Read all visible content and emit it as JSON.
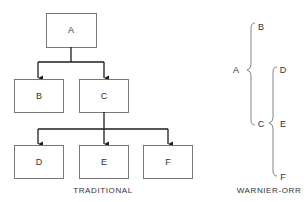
{
  "traditional": {
    "caption": "TRADITIONAL",
    "nodes": {
      "a": "A",
      "b": "B",
      "c": "C",
      "d": "D",
      "e": "E",
      "f": "F"
    }
  },
  "warnier_orr": {
    "caption": "WARNIER-ORR",
    "nodes": {
      "a": "A",
      "b": "B",
      "c": "C",
      "d": "D",
      "e": "E",
      "f": "F"
    }
  },
  "colors": {
    "box_stroke": "#6a6a6a",
    "connector": "#1e1e1e",
    "brace": "#777777",
    "text": "#333333"
  }
}
